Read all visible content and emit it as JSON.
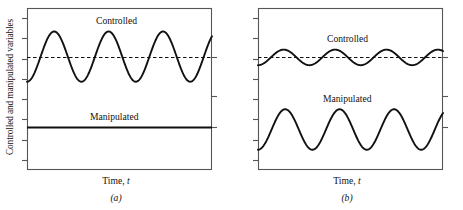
{
  "figure": {
    "background": "#ffffff",
    "line_color": "#111111",
    "axis_color": "#555555"
  },
  "panels": [
    {
      "id": "a",
      "subcaption": "(a)",
      "ylabel": "Controlled and manipulated variables",
      "xlabel_main": "Time,",
      "xlabel_var": "t",
      "labels": {
        "controlled": "Controlled",
        "manipulated": "Manipulated"
      }
    },
    {
      "id": "b",
      "subcaption": "(b)",
      "ylabel": "Controlled and manipulated variables",
      "xlabel_main": "Time,",
      "xlabel_var": "t",
      "labels": {
        "controlled": "Controlled",
        "manipulated": "Manipulated"
      }
    }
  ],
  "chart_data": [
    {
      "type": "line",
      "panel": "a",
      "title": "(a)",
      "xlabel": "Time, t",
      "ylabel": "Controlled and manipulated variables",
      "xlim": [
        0,
        1
      ],
      "ylim": [
        0,
        1
      ],
      "grid": false,
      "legend": "inline-annotations",
      "axis_ticks": {
        "left_count": 8,
        "right_count": 3,
        "labels_shown": false
      },
      "annotations": [
        {
          "text": "Controlled",
          "x": 0.44,
          "y": 0.92
        },
        {
          "text": "Manipulated",
          "x": 0.4,
          "y": 0.33
        }
      ],
      "series": [
        {
          "name": "Setpoint",
          "style": "dashed",
          "type": "constant",
          "value": 0.7,
          "amplitude": 0.0
        },
        {
          "name": "Controlled",
          "style": "solid",
          "type": "sinusoid",
          "mean": 0.7,
          "amplitude": 0.155,
          "cycles": 3.4,
          "phase_deg": 0
        },
        {
          "name": "Manipulated",
          "style": "solid",
          "type": "constant",
          "value": 0.265,
          "amplitude": 0.0
        }
      ]
    },
    {
      "type": "line",
      "panel": "b",
      "title": "(b)",
      "xlabel": "Time, t",
      "ylabel": "Controlled and manipulated variables",
      "xlim": [
        0,
        1
      ],
      "ylim": [
        0,
        1
      ],
      "grid": false,
      "legend": "inline-annotations",
      "axis_ticks": {
        "left_count": 8,
        "right_count": 3,
        "labels_shown": false
      },
      "annotations": [
        {
          "text": "Controlled",
          "x": 0.46,
          "y": 0.83
        },
        {
          "text": "Manipulated",
          "x": 0.42,
          "y": 0.46
        }
      ],
      "series": [
        {
          "name": "Setpoint",
          "style": "dashed",
          "type": "constant",
          "value": 0.7,
          "amplitude": 0.0
        },
        {
          "name": "Controlled",
          "style": "solid",
          "type": "sinusoid",
          "mean": 0.695,
          "amplitude": 0.048,
          "cycles": 3.6,
          "phase_deg": 0
        },
        {
          "name": "Manipulated",
          "style": "solid",
          "type": "sinusoid",
          "mean": 0.25,
          "amplitude": 0.125,
          "cycles": 3.4,
          "phase_deg": 0
        }
      ]
    }
  ]
}
